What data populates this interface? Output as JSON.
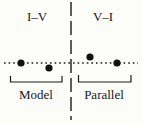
{
  "diagram": {
    "panels": [
      {
        "header": "I–V",
        "bracket_label": "Model"
      },
      {
        "header": "V–I",
        "bracket_label": "Parallel"
      }
    ],
    "colors": {
      "ink": "#1a1a1a",
      "background": "#fcfcf8"
    },
    "points": [
      {
        "panel": "I–V",
        "position": "on-baseline"
      },
      {
        "panel": "I–V",
        "position": "below-baseline"
      },
      {
        "panel": "V–I",
        "position": "above-baseline"
      },
      {
        "panel": "V–I",
        "position": "on-baseline"
      }
    ]
  }
}
